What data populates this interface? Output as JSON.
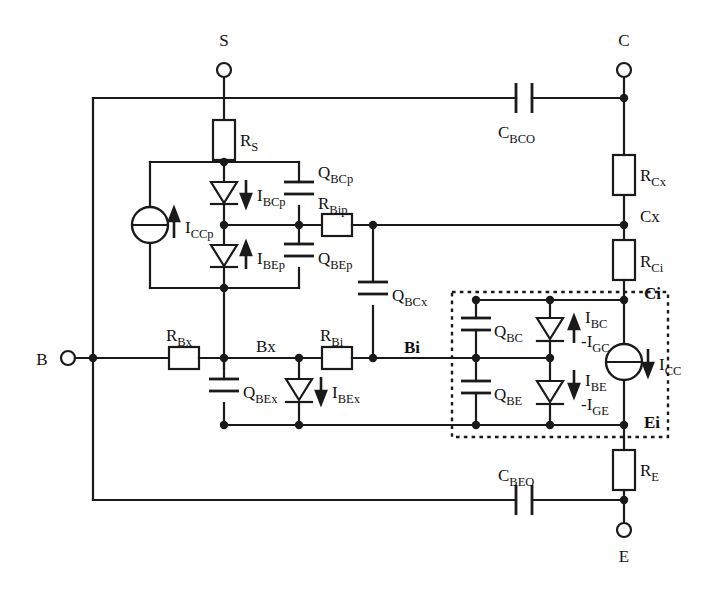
{
  "figure": {
    "kind": "circuit-schematic",
    "background": "#ffffff",
    "ink": "#1a1a1a"
  },
  "terminals": [
    {
      "id": "S",
      "label": "S",
      "x": 224,
      "y": 70,
      "label_x": 224,
      "label_y": 46
    },
    {
      "id": "C",
      "label": "C",
      "x": 624,
      "y": 70,
      "label_x": 624,
      "label_y": 46
    },
    {
      "id": "B",
      "label": "B",
      "x": 68,
      "y": 358,
      "label_x": 42,
      "label_y": 364
    },
    {
      "id": "E",
      "label": "E",
      "x": 624,
      "y": 530,
      "label_x": 624,
      "label_y": 560
    }
  ],
  "nodes": [
    {
      "id": "Bx",
      "label": "Bx",
      "bold": false,
      "x": 224,
      "y": 358,
      "label_x": 256,
      "label_y": 350
    },
    {
      "id": "Bi",
      "label": "Bi",
      "bold": true,
      "x": 373,
      "y": 358,
      "label_x": 404,
      "label_y": 351
    },
    {
      "id": "Cx",
      "label": "Cx",
      "bold": false,
      "x": 624,
      "y": 225,
      "label_x": 642,
      "label_y": 221
    },
    {
      "id": "Ci",
      "label": "Ci",
      "bold": true,
      "x": 624,
      "y": 300,
      "label_x": 644,
      "label_y": 297
    },
    {
      "id": "Ei",
      "label": "Ei",
      "bold": true,
      "x": 624,
      "y": 425,
      "label_x": 644,
      "label_y": 426
    }
  ],
  "resistors": [
    {
      "id": "RS",
      "label": "R",
      "sub": "S",
      "orient": "v",
      "x": 224,
      "y": 140,
      "label_x": 240,
      "label_y": 140
    },
    {
      "id": "RCx",
      "label": "R",
      "sub": "Cx",
      "orient": "v",
      "x": 624,
      "y": 175,
      "label_x": 641,
      "label_y": 175
    },
    {
      "id": "RCi",
      "label": "R",
      "sub": "Ci",
      "orient": "v",
      "x": 624,
      "y": 260,
      "label_x": 641,
      "label_y": 261
    },
    {
      "id": "RE",
      "label": "R",
      "sub": "E",
      "orient": "v",
      "x": 624,
      "y": 470,
      "label_x": 641,
      "label_y": 470
    },
    {
      "id": "RBx",
      "label": "R",
      "sub": "Bx",
      "orient": "h",
      "x": 184,
      "y": 358,
      "label_x": 184,
      "label_y": 338
    },
    {
      "id": "RBi",
      "label": "R",
      "sub": "Bi",
      "orient": "h",
      "x": 337,
      "y": 358,
      "label_x": 337,
      "label_y": 338
    },
    {
      "id": "RBip",
      "label": "R",
      "sub": "Bip",
      "orient": "h",
      "x": 337,
      "y": 225,
      "label_x": 337,
      "label_y": 206
    }
  ],
  "capacitors": [
    {
      "id": "CBCO",
      "label": "C",
      "sub": "BCO",
      "orient": "h",
      "x": 524,
      "y": 98,
      "label_x": 524,
      "label_y": 132
    },
    {
      "id": "CBEO",
      "label": "C",
      "sub": "BEO",
      "orient": "h",
      "x": 524,
      "y": 500,
      "label_x": 524,
      "label_y": 478
    },
    {
      "id": "QBCp",
      "label": "Q",
      "sub": "BCp",
      "orient": "v",
      "x": 299,
      "y": 194,
      "label_x": 317,
      "label_y": 176
    },
    {
      "id": "QBEp",
      "label": "Q",
      "sub": "BEp",
      "orient": "v",
      "x": 299,
      "y": 256,
      "label_x": 317,
      "label_y": 258
    },
    {
      "id": "QBCx",
      "label": "Q",
      "sub": "BCx",
      "orient": "v",
      "x": 373,
      "y": 294,
      "label_x": 391,
      "label_y": 295
    },
    {
      "id": "QBEx",
      "label": "Q",
      "sub": "BEx",
      "orient": "v",
      "x": 224,
      "y": 391,
      "label_x": 242,
      "label_y": 392
    },
    {
      "id": "QBC",
      "label": "Q",
      "sub": "BC",
      "orient": "v",
      "x": 476,
      "y": 330,
      "label_x": 494,
      "label_y": 331
    },
    {
      "id": "QBE",
      "label": "Q",
      "sub": "BE",
      "orient": "v",
      "x": 476,
      "y": 393,
      "label_x": 494,
      "label_y": 394
    }
  ],
  "diodes": [
    {
      "id": "DBCp",
      "x": 224,
      "y": 194,
      "tri": "down",
      "current": {
        "label": "I",
        "sub": "BCp",
        "arrow": "down",
        "x": 246,
        "y": 194,
        "label_x": 258,
        "label_y": 200
      }
    },
    {
      "id": "DBEp",
      "x": 224,
      "y": 256,
      "tri": "down",
      "current": {
        "label": "I",
        "sub": "BEp",
        "arrow": "up",
        "x": 246,
        "y": 256,
        "label_x": 258,
        "label_y": 263
      }
    },
    {
      "id": "DBEx",
      "x": 299,
      "y": 391,
      "tri": "down",
      "current": {
        "label": "I",
        "sub": "BEx",
        "arrow": "down",
        "x": 321,
        "y": 391,
        "label_x": 333,
        "label_y": 397
      }
    },
    {
      "id": "DBC",
      "x": 550,
      "y": 330,
      "tri": "down",
      "current": {
        "label": "I",
        "sub": "BC",
        "arrow": "up",
        "x": 574,
        "y": 330,
        "label_x": 586,
        "label_y": 322,
        "label2": "-I",
        "sub2": "GC",
        "label2_x": 586,
        "label2_y": 346
      }
    },
    {
      "id": "DBE",
      "x": 550,
      "y": 393,
      "tri": "down",
      "current": {
        "label": "I",
        "sub": "BE",
        "arrow": "down",
        "x": 574,
        "y": 393,
        "label_x": 586,
        "label_y": 385,
        "label2": "-I",
        "sub2": "GE",
        "label2_x": 586,
        "label2_y": 409
      }
    }
  ],
  "sources": [
    {
      "id": "ICCp",
      "x": 150,
      "y": 225,
      "r": 18,
      "label": "I",
      "sub": "CCp",
      "arrow": "up",
      "arrow_x": 174,
      "arrow_y": 225,
      "label_x": 186,
      "label_y": 232
    },
    {
      "id": "ICC",
      "x": 624,
      "y": 362,
      "r": 18,
      "label": "I",
      "sub": "CC",
      "arrow": "down",
      "arrow_x": 648,
      "arrow_y": 362,
      "label_x": 660,
      "label_y": 369
    }
  ],
  "regions": [
    {
      "id": "intrinsic-transistor",
      "x": 452,
      "y": 292,
      "w": 216,
      "h": 145,
      "style": "dotted"
    }
  ],
  "buses": {
    "left_rail_x": 93,
    "top_rail_y": 98,
    "bottom_rail_y": 500,
    "right_col_x": 624,
    "substrate_col_x": 224
  }
}
